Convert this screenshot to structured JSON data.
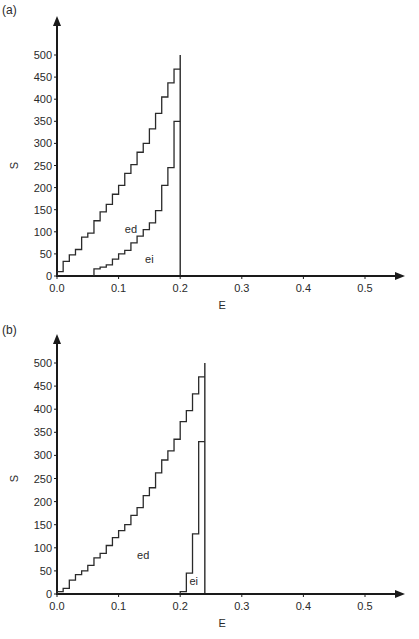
{
  "chart_data": [
    {
      "type": "line",
      "panel_label": "(a)",
      "title": "",
      "xlabel": "E",
      "ylabel": "S",
      "xlim": [
        0.0,
        0.55
      ],
      "ylim": [
        0,
        520
      ],
      "x_ticks": [
        0.0,
        0.1,
        0.2,
        0.3,
        0.4,
        0.5
      ],
      "x_tick_labels": [
        "0.0",
        "0.1",
        "0.2",
        "0.3",
        "0.4",
        "0.5"
      ],
      "y_ticks": [
        0,
        50,
        100,
        150,
        200,
        250,
        300,
        350,
        400,
        450,
        500
      ],
      "y_tick_labels": [
        "0",
        "50",
        "100",
        "150",
        "200",
        "250",
        "300",
        "350",
        "400",
        "450",
        "500"
      ],
      "grid": false,
      "legend": "none (inline curve labels)",
      "vertical_line_at": 0.2,
      "vertical_line_top": 500,
      "series": [
        {
          "name": "ed",
          "step": true,
          "x": [
            0.0,
            0.01,
            0.02,
            0.03,
            0.04,
            0.05,
            0.06,
            0.07,
            0.08,
            0.09,
            0.1,
            0.11,
            0.12,
            0.13,
            0.14,
            0.15,
            0.16,
            0.17,
            0.18,
            0.19
          ],
          "values": [
            10,
            33,
            48,
            60,
            88,
            97,
            125,
            145,
            162,
            185,
            205,
            232,
            252,
            280,
            300,
            333,
            368,
            405,
            437,
            468
          ],
          "label_pos": [
            0.12,
            98
          ]
        },
        {
          "name": "ei",
          "step": true,
          "x": [
            0.06,
            0.07,
            0.08,
            0.09,
            0.1,
            0.11,
            0.12,
            0.13,
            0.14,
            0.15,
            0.16,
            0.17,
            0.18,
            0.19
          ],
          "values": [
            16,
            20,
            25,
            38,
            50,
            58,
            75,
            90,
            105,
            120,
            148,
            205,
            245,
            350
          ],
          "label_pos": [
            0.15,
            30
          ]
        }
      ]
    },
    {
      "type": "line",
      "panel_label": "(b)",
      "title": "",
      "xlabel": "E",
      "ylabel": "S",
      "xlim": [
        0.0,
        0.55
      ],
      "ylim": [
        0,
        520
      ],
      "x_ticks": [
        0.0,
        0.1,
        0.2,
        0.3,
        0.4,
        0.5
      ],
      "x_tick_labels": [
        "0.0",
        "0.1",
        "0.2",
        "0.3",
        "0.4",
        "0.5"
      ],
      "y_ticks": [
        0,
        50,
        100,
        150,
        200,
        250,
        300,
        350,
        400,
        450,
        500
      ],
      "y_tick_labels": [
        "0",
        "50",
        "100",
        "150",
        "200",
        "250",
        "300",
        "350",
        "400",
        "450",
        "500"
      ],
      "grid": false,
      "legend": "none (inline curve labels)",
      "vertical_line_at": 0.24,
      "vertical_line_top": 500,
      "series": [
        {
          "name": "ed",
          "step": true,
          "x": [
            0.0,
            0.01,
            0.02,
            0.03,
            0.04,
            0.05,
            0.06,
            0.07,
            0.08,
            0.09,
            0.1,
            0.11,
            0.12,
            0.13,
            0.14,
            0.15,
            0.16,
            0.17,
            0.18,
            0.19,
            0.2,
            0.21,
            0.22,
            0.23
          ],
          "values": [
            5,
            12,
            30,
            42,
            50,
            62,
            78,
            88,
            105,
            122,
            137,
            150,
            170,
            187,
            213,
            230,
            262,
            290,
            310,
            335,
            373,
            397,
            433,
            470
          ],
          "label_pos": [
            0.14,
            75
          ]
        },
        {
          "name": "ei",
          "step": true,
          "x": [
            0.2,
            0.21,
            0.22,
            0.23
          ],
          "values": [
            5,
            45,
            130,
            330
          ],
          "label_pos": [
            0.222,
            20
          ]
        }
      ]
    }
  ]
}
